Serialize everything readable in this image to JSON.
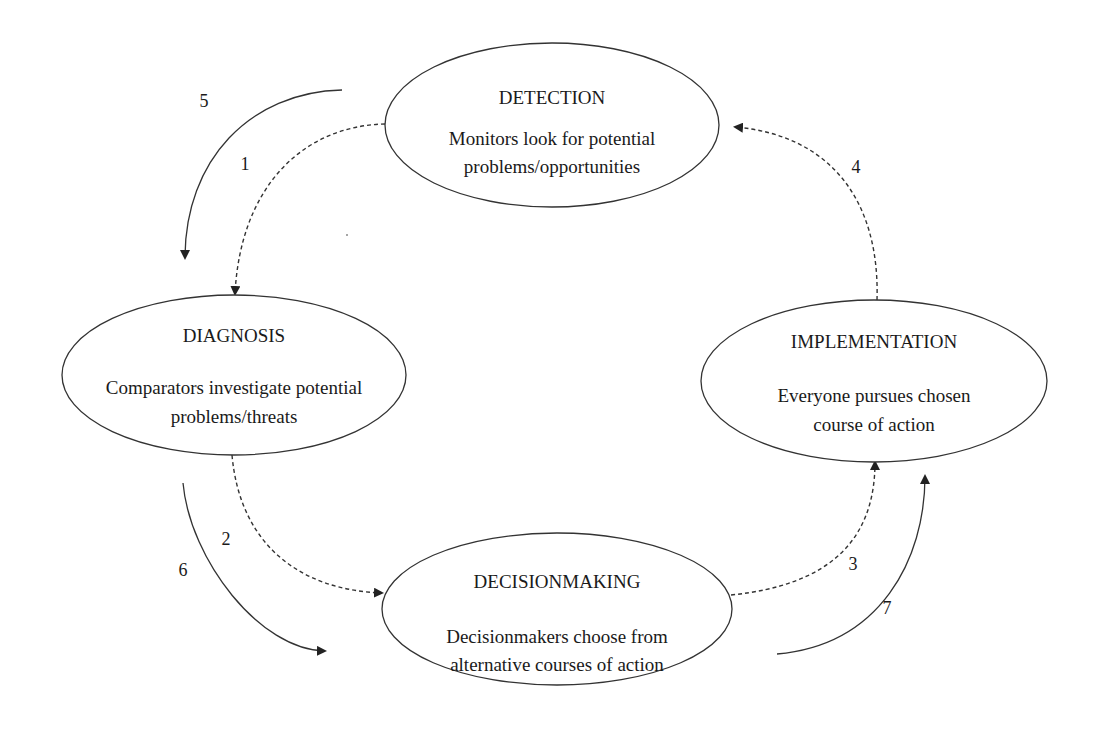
{
  "diagram": {
    "nodes": [
      {
        "id": "detection",
        "title": "DETECTION",
        "desc_line1": "Monitors look for potential",
        "desc_line2": "problems/opportunities"
      },
      {
        "id": "diagnosis",
        "title": "DIAGNOSIS",
        "desc_line1": "Comparators investigate potential",
        "desc_line2": "problems/threats"
      },
      {
        "id": "implementation",
        "title": "IMPLEMENTATION",
        "desc_line1": "Everyone pursues chosen",
        "desc_line2": "course of action"
      },
      {
        "id": "decisionmaking",
        "title": "DECISIONMAKING",
        "desc_line1": "Decisionmakers choose from",
        "desc_line2": "alternative courses of action"
      }
    ],
    "edges": [
      {
        "label": "1",
        "from": "detection",
        "to": "diagnosis",
        "style": "dashed"
      },
      {
        "label": "2",
        "from": "diagnosis",
        "to": "decisionmaking",
        "style": "dashed"
      },
      {
        "label": "3",
        "from": "decisionmaking",
        "to": "implementation",
        "style": "dashed"
      },
      {
        "label": "4",
        "from": "implementation",
        "to": "detection",
        "style": "dashed"
      },
      {
        "label": "5",
        "from": "detection",
        "to": "diagnosis",
        "style": "solid"
      },
      {
        "label": "6",
        "from": "diagnosis",
        "to": "decisionmaking",
        "style": "solid"
      },
      {
        "label": "7",
        "from": "decisionmaking",
        "to": "implementation",
        "style": "solid"
      }
    ],
    "colors": {
      "line": "#333333",
      "text": "#1a1a1a",
      "background": "#ffffff"
    }
  }
}
